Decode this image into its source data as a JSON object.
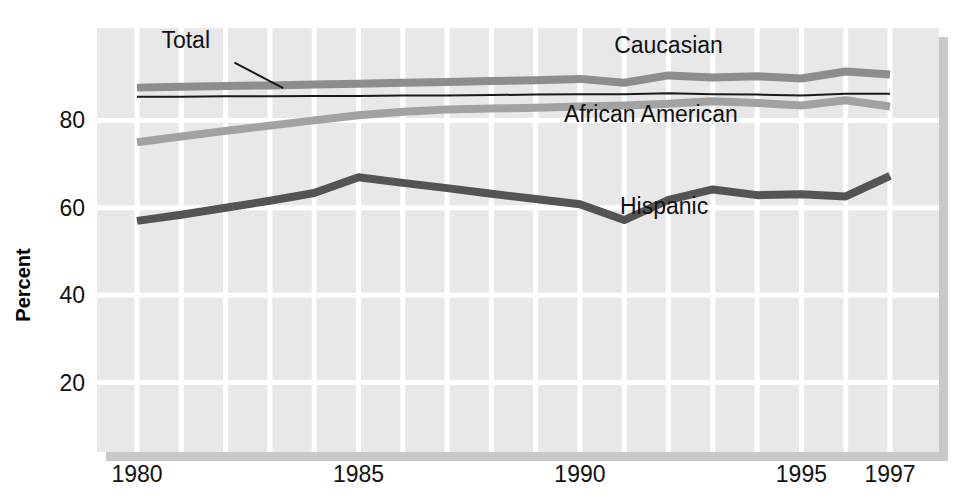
{
  "chart_data": {
    "type": "line",
    "title": "",
    "xlabel": "",
    "ylabel": "Percent",
    "xlim": [
      1980,
      1997
    ],
    "ylim": [
      0,
      100
    ],
    "grid": true,
    "legend_position": "inline-annotations",
    "x": [
      1980,
      1981,
      1982,
      1983,
      1984,
      1985,
      1986,
      1987,
      1988,
      1989,
      1990,
      1991,
      1992,
      1993,
      1994,
      1995,
      1996,
      1997
    ],
    "xtick_labels": [
      "1980",
      "1985",
      "1990",
      "1995",
      "1997"
    ],
    "xtick_values": [
      1980,
      1985,
      1990,
      1995,
      1997
    ],
    "ytick_labels": [
      "20",
      "40",
      "60",
      "80"
    ],
    "ytick_values": [
      20,
      40,
      60,
      80
    ],
    "series": [
      {
        "name": "Caucasian",
        "color": "#8d8d8d",
        "width": 8,
        "label_x": 1992.0,
        "label_y": 95.5,
        "values": [
          87.5,
          87.7,
          87.9,
          88.0,
          88.2,
          88.4,
          88.6,
          88.8,
          89.0,
          89.2,
          89.5,
          88.6,
          90.3,
          89.8,
          90.1,
          89.6,
          91.2,
          90.5
        ]
      },
      {
        "name": "Total",
        "color": "#1a1a1a",
        "width": 2,
        "label_x": 1981.1,
        "label_y": 96.6,
        "leader": {
          "x1": 1982.2,
          "y1": 93.2,
          "x2": 1983.3,
          "y2": 87.4
        },
        "values": [
          85.4,
          85.4,
          85.5,
          85.5,
          85.6,
          85.6,
          85.7,
          85.7,
          85.8,
          85.9,
          86.0,
          86.0,
          86.2,
          86.0,
          85.9,
          85.7,
          86.1,
          86.1
        ]
      },
      {
        "name": "African American",
        "color": "#a2a2a2",
        "width": 8,
        "label_x": 1991.6,
        "label_y": 79.6,
        "values": [
          75.0,
          76.3,
          77.6,
          78.8,
          80.0,
          81.2,
          82.0,
          82.5,
          82.7,
          82.9,
          83.2,
          83.4,
          83.8,
          84.4,
          84.0,
          83.4,
          84.6,
          83.2
        ]
      },
      {
        "name": "Hispanic",
        "color": "#545454",
        "width": 8,
        "label_x": 1991.9,
        "label_y": 58.5,
        "values": [
          57.0,
          58.4,
          60.0,
          61.6,
          63.4,
          67.0,
          65.7,
          64.5,
          63.2,
          62.0,
          60.8,
          57.2,
          61.8,
          64.2,
          62.9,
          63.1,
          62.6,
          67.3
        ]
      }
    ]
  },
  "figure": {
    "plot_bg": "#e8e8e8",
    "grid_color": "#ffffff",
    "shadow_color": "#9c9c9c",
    "page_bg": "#ffffff"
  }
}
